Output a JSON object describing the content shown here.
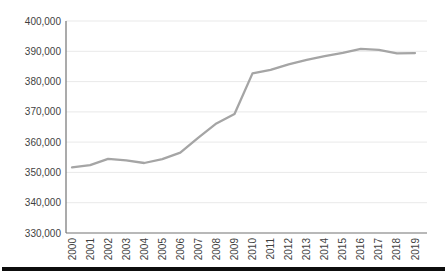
{
  "page": {
    "background": "#ffffff",
    "divider_color": "#0d0d0d"
  },
  "chart_data": {
    "type": "line",
    "title": "",
    "xlabel": "",
    "ylabel": "",
    "categories": [
      "2000",
      "2001",
      "2002",
      "2003",
      "2004",
      "2005",
      "2006",
      "2007",
      "2008",
      "2009",
      "2010",
      "2011",
      "2012",
      "2013",
      "2014",
      "2015",
      "2016",
      "2017",
      "2018",
      "2019"
    ],
    "series": [
      {
        "name": "value",
        "values": [
          351700,
          352400,
          354500,
          354000,
          353100,
          354400,
          356500,
          361500,
          366200,
          369300,
          382700,
          383900,
          385700,
          387200,
          388400,
          389500,
          390800,
          390500,
          389300,
          389400
        ]
      }
    ],
    "ylim": [
      330000,
      400000
    ],
    "ytick_step": 10000,
    "ytick_labels": [
      "330,000",
      "340,000",
      "350,000",
      "360,000",
      "370,000",
      "380,000",
      "390,000",
      "400,000"
    ],
    "grid": true,
    "legend": "none",
    "line_color": "#a5a5a5",
    "gridline_color": "#e9e9e9",
    "axis_color": "#737373",
    "tick_label_color": "#3f3f3f"
  }
}
